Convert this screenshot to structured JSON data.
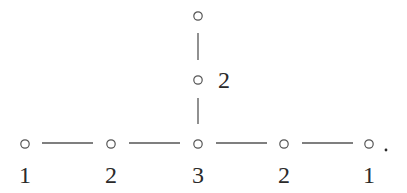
{
  "diagram": {
    "type": "dynkin-diagram",
    "nodes": [
      {
        "id": "n1",
        "x": 25,
        "y": 144,
        "label": "1",
        "label_pos": "below"
      },
      {
        "id": "n2",
        "x": 111,
        "y": 144,
        "label": "2",
        "label_pos": "below"
      },
      {
        "id": "n3",
        "x": 198,
        "y": 144,
        "label": "3",
        "label_pos": "below"
      },
      {
        "id": "n4",
        "x": 284,
        "y": 144,
        "label": "2",
        "label_pos": "below"
      },
      {
        "id": "n5",
        "x": 369,
        "y": 144,
        "label": "1",
        "label_pos": "below"
      },
      {
        "id": "n6",
        "x": 198,
        "y": 80,
        "label": "2",
        "label_pos": "right"
      },
      {
        "id": "n7",
        "x": 198,
        "y": 16,
        "label": "",
        "label_pos": "none"
      }
    ],
    "edges": [
      {
        "from": "n1",
        "to": "n2",
        "x1": 42,
        "y1": 143,
        "x2": 93,
        "y2": 143
      },
      {
        "from": "n2",
        "to": "n3",
        "x1": 129,
        "y1": 143,
        "x2": 180,
        "y2": 143
      },
      {
        "from": "n3",
        "to": "n4",
        "x1": 216,
        "y1": 143,
        "x2": 267,
        "y2": 143
      },
      {
        "from": "n4",
        "to": "n5",
        "x1": 302,
        "y1": 143,
        "x2": 353,
        "y2": 143
      },
      {
        "from": "n3",
        "to": "n6",
        "x1": 198,
        "y1": 98,
        "x2": 198,
        "y2": 124
      },
      {
        "from": "n6",
        "to": "n7",
        "x1": 198,
        "y1": 33,
        "x2": 198,
        "y2": 60
      }
    ],
    "trailing_punctuation": "."
  },
  "labels": {
    "n1": "1",
    "n2": "2",
    "n3": "3",
    "n4": "2",
    "n5": "1",
    "n6": "2"
  },
  "colors": {
    "stroke": "#555555",
    "text": "#2a2a2a",
    "background": "#ffffff"
  }
}
